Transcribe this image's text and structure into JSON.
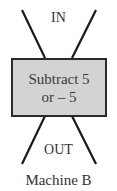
{
  "diagram": {
    "input_label": "IN",
    "operation": {
      "line1": "Subtract 5",
      "line2": "or – 5"
    },
    "output_label": "OUT",
    "caption": "Machine B"
  },
  "colors": {
    "box_fill": "#d3d3d3",
    "stroke": "#1a1a1a"
  }
}
